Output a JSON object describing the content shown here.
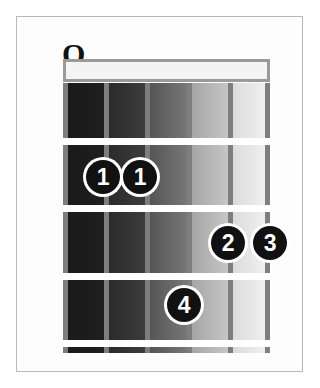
{
  "diagram": {
    "type": "guitar-chord-diagram",
    "frame": {
      "border_color": "#b9b9b9",
      "background": "#fdfdfd"
    },
    "string_count": 6,
    "fret_count": 4,
    "colors": {
      "nut": "#f4f4f4",
      "nut_border": "#9a9a9a",
      "string_line": "#7e7e7e",
      "fret_line": "#ffffff",
      "dot_fill": "#111111",
      "dot_ring": "#ffffff",
      "dot_text": "#ffffff",
      "open_symbol": "#111111"
    },
    "board_gradient": {
      "description": "inter-string cells shade dark on the low-string side to light on the high-string side",
      "cells": [
        {
          "from": "#1a1a1a",
          "to": "#1f1f1f"
        },
        {
          "from": "#2b2b2b",
          "to": "#3c3c3c"
        },
        {
          "from": "#555555",
          "to": "#777777"
        },
        {
          "from": "#a5a5a5",
          "to": "#c6c6c6"
        },
        {
          "from": "#dcdcdc",
          "to": "#efefef"
        }
      ]
    }
  },
  "open_strings": [
    {
      "symbol": "O",
      "label": "open-string-marker",
      "string": 1,
      "x": 46,
      "y": 21
    }
  ],
  "finger_dots": [
    {
      "label": "1",
      "string": 2,
      "fret": 2,
      "x": 86,
      "y": 160
    },
    {
      "label": "1",
      "string": 3,
      "fret": 2,
      "x": 123,
      "y": 160
    },
    {
      "label": "2",
      "string": 5,
      "fret": 3,
      "x": 211,
      "y": 226
    },
    {
      "label": "3",
      "string": 6,
      "fret": 3,
      "x": 253,
      "y": 226
    },
    {
      "label": "4",
      "string": 4,
      "fret": 4,
      "x": 167,
      "y": 288
    }
  ],
  "string_lines_x": [
    0,
    41,
    82,
    124,
    165,
    202
  ],
  "fret_lines_y": [
    55,
    122,
    190,
    257
  ],
  "cells_x": [
    5,
    46,
    87,
    129,
    170
  ],
  "cells_w": [
    36,
    36,
    37,
    36,
    32
  ]
}
